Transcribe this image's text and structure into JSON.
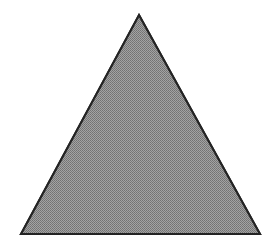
{
  "figure": {
    "name": "triangle",
    "shape_type": "triangle",
    "classification": "equilateral-triangle",
    "orientation": "apex-up",
    "canvas": {
      "width": 277,
      "height": 237,
      "background_color": "#ffffff"
    },
    "style": {
      "fill_color": "#808080",
      "fill_texture": "dithered-halftone",
      "stroke_color": "#242424",
      "stroke_width": 2,
      "stroke_linejoin": "miter"
    },
    "vertices": [
      {
        "label": "apex",
        "x": 139,
        "y": 15
      },
      {
        "label": "bottom-right",
        "x": 260,
        "y": 234
      },
      {
        "label": "bottom-left",
        "x": 21,
        "y": 234
      }
    ],
    "points_string": "139,15 260,234 21,234",
    "measurements": {
      "base_width": 239,
      "height": 219,
      "apex_x": 139,
      "baseline_y": 234
    }
  }
}
